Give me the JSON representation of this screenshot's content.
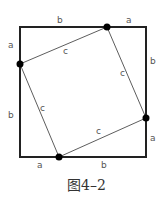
{
  "diagram": {
    "caption": "图4–2",
    "labels": {
      "top_left_b": "b",
      "top_right_a": "a",
      "left_top_a": "a",
      "left_bottom_b": "b",
      "right_top_b": "b",
      "right_bottom_a": "a",
      "bottom_left_a": "a",
      "bottom_right_b": "b",
      "inner_top_c": "c",
      "inner_right_c": "c",
      "inner_left_c": "c",
      "inner_bottom_c": "c"
    },
    "colors": {
      "outer": "#222222",
      "inner": "#333333",
      "point": "#000000"
    }
  }
}
